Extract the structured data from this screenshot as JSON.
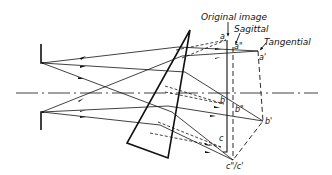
{
  "diagram": {
    "labels": {
      "original_image": "Original image",
      "sagittal": "Sagittal",
      "tangential": "Tangential"
    },
    "points": {
      "a": "a",
      "a_double_prime": "a\"",
      "a_prime": "a'",
      "b": "b",
      "b_double_prime": "b\"",
      "b_prime": "b'",
      "c": "c",
      "c_combined": "c\"/c'"
    },
    "colors": {
      "line": "#111111",
      "background": "#ffffff"
    }
  }
}
